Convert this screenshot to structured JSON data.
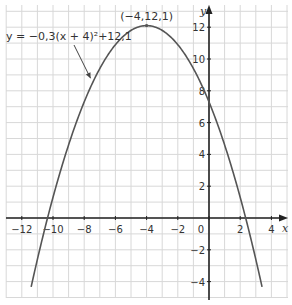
{
  "chart_data": {
    "type": "line",
    "title": "",
    "xlabel": "x",
    "ylabel": "y",
    "xlim": [
      -13,
      5
    ],
    "ylim": [
      -5,
      13
    ],
    "grid": true,
    "x_ticks": [
      -12,
      -10,
      -8,
      -6,
      -4,
      -2,
      0,
      2,
      4
    ],
    "x_tick_labels": [
      "-12",
      "-10",
      "-8",
      "-6",
      "-4",
      "-2",
      "0",
      "2",
      "4"
    ],
    "y_ticks": [
      -4,
      -2,
      2,
      4,
      6,
      8,
      10,
      12
    ],
    "y_tick_labels": [
      "-4",
      "-2",
      "2",
      "4",
      "6",
      "8",
      "10",
      "12"
    ],
    "series": [
      {
        "name": "y = -0,3(x + 4)^2 + 12,1",
        "function": {
          "a": -0.3,
          "h": -4,
          "k": 12.1
        },
        "x_range": [
          -11.4,
          3.4
        ],
        "color": "#555555"
      }
    ],
    "annotations": [
      {
        "text": "(−4,12,1)",
        "x": -4,
        "y": 12.1,
        "type": "vertex-label"
      },
      {
        "text": "y = −0,3(x + 4)²+12,1",
        "type": "equation-label",
        "arrow_to": {
          "x": -7.4,
          "y": 8.6
        }
      }
    ],
    "colors": {
      "grid": "#d8d8d8",
      "axis": "#222222",
      "curve": "#555555",
      "text": "#333333"
    }
  }
}
